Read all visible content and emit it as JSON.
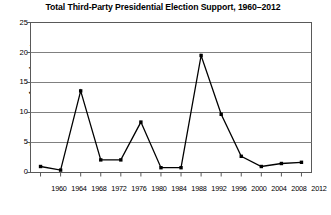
{
  "chart_data": {
    "type": "line",
    "title": "Total Third-Party Presidential Election Support, 1960–2012",
    "xlabel": "",
    "ylabel": "Percentage of popular vote",
    "categories": [
      "1960",
      "1964",
      "1968",
      "1972",
      "1976",
      "1980",
      "1984",
      "1988",
      "1992",
      "1996",
      "2000",
      "2004",
      "2008",
      "2012"
    ],
    "x": [
      1960,
      1964,
      1968,
      1972,
      1976,
      1980,
      1984,
      1988,
      1992,
      1996,
      2000,
      2004,
      2008,
      2012
    ],
    "values": [
      1.0,
      0.4,
      13.6,
      2.1,
      2.1,
      8.4,
      0.8,
      0.8,
      19.5,
      9.7,
      2.7,
      1.0,
      1.5,
      1.7
    ],
    "series": [
      {
        "name": "Total third-party support",
        "values": [
          1.0,
          0.4,
          13.6,
          2.1,
          2.1,
          8.4,
          0.8,
          0.8,
          19.5,
          9.7,
          2.7,
          1.0,
          1.5,
          1.7
        ]
      }
    ],
    "ylim": [
      0,
      25
    ],
    "yticks": [
      0,
      5,
      10,
      15,
      20,
      25
    ],
    "ytick_labels": [
      "0",
      "5",
      "10",
      "15",
      "20",
      "25"
    ],
    "xtick_labels": [
      "1960",
      "1964",
      "1968",
      "1972",
      "1976",
      "1980",
      "1984",
      "1988",
      "1992",
      "1996",
      "2000",
      "2004",
      "2008",
      "2012"
    ],
    "grid": "horizontal",
    "legend": "none",
    "line_color": "#000000",
    "marker": "square",
    "marker_color": "#000000",
    "grid_color": "#808080",
    "axis_color": "#595959",
    "background": "#ffffff"
  }
}
